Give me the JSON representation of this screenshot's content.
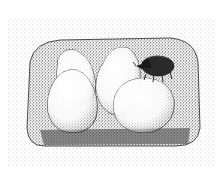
{
  "illustration": {
    "style": "stippled pen-and-ink",
    "subject": "beetle resting on egg-shaped objects inside a rounded burrow chamber",
    "colors": {
      "ink": "#1a1a1a",
      "paper": "#ffffff",
      "shade": "#8a8a8a"
    },
    "elements": [
      "burrow-chamber",
      "egg-back-left",
      "egg-back-right",
      "egg-front-left",
      "egg-front-right",
      "beetle"
    ]
  }
}
